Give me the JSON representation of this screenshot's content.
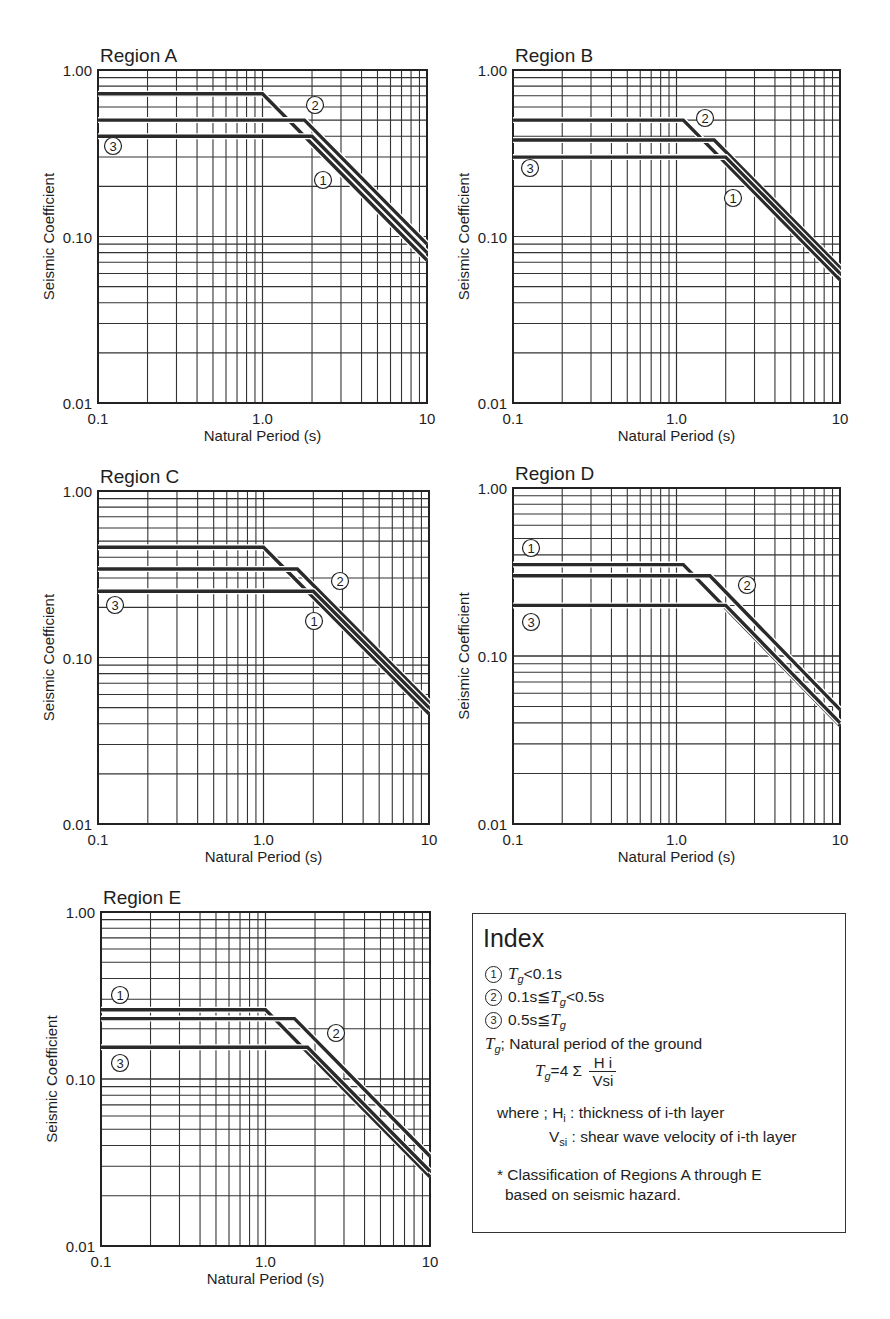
{
  "figure": {
    "x_axis_label": "Natural Period (s)",
    "y_axis_label": "Seismic Coefficient",
    "x_ticks": [
      "0.1",
      "1.0",
      "10"
    ],
    "y_ticks": [
      "1.00",
      "0.10",
      "0.01"
    ]
  },
  "index": {
    "title": "Index",
    "items": [
      {
        "marker": "1",
        "text": "Tg<0.1s"
      },
      {
        "marker": "2",
        "text": "0.1s≦Tg<0.5s"
      },
      {
        "marker": "3",
        "text": "0.5s≦Tg"
      }
    ],
    "tg_def": "; Natural period of the ground",
    "formula_lhs": "=4 Σ",
    "formula_num": "H i",
    "formula_den": "Vsi",
    "where_label": "where ; H",
    "where_h": ": thickness of i-th layer",
    "where_v": ": shear wave velocity of i-th layer",
    "note_line1": "* Classification of Regions A through E",
    "note_line2": "based on seismic hazard."
  },
  "chart_data": [
    {
      "type": "line",
      "title": "Region A",
      "xlabel": "Natural Period (s)",
      "ylabel": "Seismic Coefficient",
      "xscale": "log",
      "yscale": "log",
      "xlim": [
        0.1,
        10
      ],
      "ylim": [
        0.01,
        1.0
      ],
      "grid": true,
      "series": [
        {
          "name": "1",
          "x": [
            0.1,
            1.0,
            10
          ],
          "y": [
            0.72,
            0.72,
            0.072
          ]
        },
        {
          "name": "2",
          "x": [
            0.1,
            1.8,
            10
          ],
          "y": [
            0.5,
            0.5,
            0.09
          ]
        },
        {
          "name": "3",
          "x": [
            0.1,
            2.0,
            10
          ],
          "y": [
            0.4,
            0.4,
            0.08
          ]
        }
      ]
    },
    {
      "type": "line",
      "title": "Region B",
      "xlabel": "Natural Period (s)",
      "ylabel": "Seismic Coefficient",
      "xscale": "log",
      "yscale": "log",
      "xlim": [
        0.1,
        10
      ],
      "ylim": [
        0.01,
        1.0
      ],
      "grid": true,
      "series": [
        {
          "name": "1",
          "x": [
            0.1,
            1.1,
            10
          ],
          "y": [
            0.5,
            0.5,
            0.055
          ]
        },
        {
          "name": "2",
          "x": [
            0.1,
            1.7,
            10
          ],
          "y": [
            0.38,
            0.38,
            0.065
          ]
        },
        {
          "name": "3",
          "x": [
            0.1,
            2.0,
            10
          ],
          "y": [
            0.3,
            0.3,
            0.06
          ]
        }
      ]
    },
    {
      "type": "line",
      "title": "Region C",
      "xlabel": "Natural Period (s)",
      "ylabel": "Seismic Coefficient",
      "xscale": "log",
      "yscale": "log",
      "xlim": [
        0.1,
        10
      ],
      "ylim": [
        0.01,
        1.0
      ],
      "grid": true,
      "series": [
        {
          "name": "1",
          "x": [
            0.1,
            1.0,
            10
          ],
          "y": [
            0.46,
            0.46,
            0.046
          ]
        },
        {
          "name": "2",
          "x": [
            0.1,
            1.6,
            10
          ],
          "y": [
            0.34,
            0.34,
            0.054
          ]
        },
        {
          "name": "3",
          "x": [
            0.1,
            2.0,
            10
          ],
          "y": [
            0.25,
            0.25,
            0.05
          ]
        }
      ]
    },
    {
      "type": "line",
      "title": "Region D",
      "xlabel": "Natural Period (s)",
      "ylabel": "Seismic Coefficient",
      "xscale": "log",
      "yscale": "log",
      "xlim": [
        0.1,
        10
      ],
      "ylim": [
        0.01,
        1.0
      ],
      "grid": true,
      "series": [
        {
          "name": "1",
          "x": [
            0.1,
            1.1,
            10
          ],
          "y": [
            0.35,
            0.35,
            0.0385
          ]
        },
        {
          "name": "2",
          "x": [
            0.1,
            1.6,
            10
          ],
          "y": [
            0.3,
            0.3,
            0.048
          ]
        },
        {
          "name": "3",
          "x": [
            0.1,
            2.0,
            10
          ],
          "y": [
            0.2,
            0.2,
            0.04
          ]
        }
      ]
    },
    {
      "type": "line",
      "title": "Region E",
      "xlabel": "Natural Period (s)",
      "ylabel": "Seismic Coefficient",
      "xscale": "log",
      "yscale": "log",
      "xlim": [
        0.1,
        10
      ],
      "ylim": [
        0.01,
        1.0
      ],
      "grid": true,
      "series": [
        {
          "name": "1",
          "x": [
            0.1,
            1.0,
            10
          ],
          "y": [
            0.26,
            0.26,
            0.026
          ]
        },
        {
          "name": "2",
          "x": [
            0.1,
            1.5,
            10
          ],
          "y": [
            0.23,
            0.23,
            0.0345
          ]
        },
        {
          "name": "3",
          "x": [
            0.1,
            1.8,
            10
          ],
          "y": [
            0.155,
            0.155,
            0.028
          ]
        }
      ]
    }
  ],
  "panel_layout": [
    {
      "left": 98,
      "top": 70,
      "right": 427,
      "bottom": 403,
      "labels": {
        "1": [
          323,
          180
        ],
        "2": [
          315,
          105
        ],
        "3": [
          113,
          146
        ]
      }
    },
    {
      "left": 513,
      "top": 70,
      "right": 840,
      "bottom": 403,
      "labels": {
        "1": [
          733,
          198
        ],
        "2": [
          705,
          118
        ],
        "3": [
          530,
          168
        ]
      }
    },
    {
      "left": 98,
      "top": 491,
      "right": 429,
      "bottom": 824,
      "labels": {
        "1": [
          314,
          621
        ],
        "2": [
          340,
          581
        ],
        "3": [
          115,
          605
        ]
      }
    },
    {
      "left": 513,
      "top": 488,
      "right": 840,
      "bottom": 824,
      "labels": {
        "1": [
          531,
          548
        ],
        "2": [
          747,
          585
        ],
        "3": [
          531,
          622
        ]
      }
    },
    {
      "left": 101,
      "top": 912,
      "right": 430,
      "bottom": 1246,
      "labels": {
        "1": [
          120,
          995
        ],
        "2": [
          336,
          1033
        ],
        "3": [
          120,
          1063
        ]
      }
    }
  ]
}
